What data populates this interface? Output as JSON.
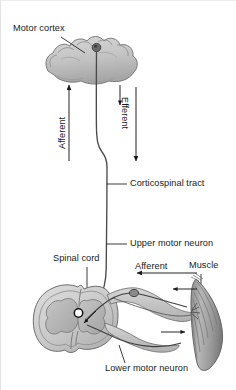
{
  "figure": {
    "palette": {
      "ink": "#1a1a1a",
      "stroke": "#3a3a3a",
      "tissue_light": "#d2d2d2",
      "tissue_mid": "#b4b4b4",
      "tissue_dark": "#8f8f8f",
      "muscle": "#a8a8a8",
      "background": "#ffffff"
    }
  },
  "labels": {
    "motor_cortex": "Motor cortex",
    "afferent_upper": "Afferent",
    "efferent_upper": "Efferent",
    "corticospinal_tract": "Corticospinal tract",
    "upper_motor_neuron": "Upper motor neuron",
    "spinal_cord": "Spinal cord",
    "afferent_lower": "Afferent",
    "muscle": "Muscle",
    "lower_motor_neuron": "Lower motor neuron",
    "central_canal": "O"
  },
  "structures": [
    {
      "name": "motor-cortex",
      "type": "brain-gyri",
      "note": "gray cortical ribbon with pyramidal cell body"
    },
    {
      "name": "upper-motor-neuron-axon",
      "type": "descending-fiber",
      "note": "long axon from cortex to spinal cord"
    },
    {
      "name": "spinal-cord-cross-section",
      "type": "transverse-section",
      "note": "butterfly gray matter, white matter, central canal"
    },
    {
      "name": "dorsal-root-ganglion",
      "type": "ganglion",
      "note": "sensory cell body on dorsal root"
    },
    {
      "name": "lower-motor-neuron-axon",
      "type": "peripheral-nerve",
      "note": "ventral root to neuromuscular junction"
    },
    {
      "name": "skeletal-muscle",
      "type": "striated-muscle",
      "note": "fusiform belly with fiber striations"
    }
  ],
  "arrows": [
    {
      "name": "afferent-upper-arrow",
      "direction": "up",
      "meaning": "sensory signal ascending to cortex"
    },
    {
      "name": "efferent-upper-arrow",
      "direction": "down",
      "meaning": "motor command descending from cortex"
    },
    {
      "name": "afferent-lower-arrow",
      "direction": "left",
      "meaning": "sensory input from muscle to cord"
    },
    {
      "name": "muscle-sensory-arrow",
      "direction": "left",
      "meaning": "afferent fiber leaving muscle"
    },
    {
      "name": "muscle-motor-arrow",
      "direction": "right",
      "meaning": "efferent fiber reaching muscle"
    },
    {
      "name": "reflex-arrow",
      "direction": "down-left",
      "meaning": "synapse onto lower motor neuron"
    }
  ]
}
